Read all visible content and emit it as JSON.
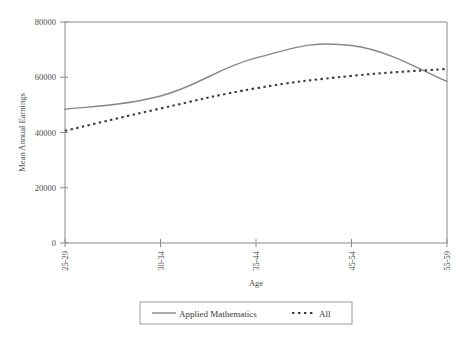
{
  "chart_data": {
    "type": "line",
    "title": "",
    "subtitle": "",
    "xlabel": "Age",
    "ylabel": "Mean Annual Earnings",
    "categories": [
      "25-29",
      "30-34",
      "35-44",
      "45-54",
      "55-59"
    ],
    "xtick_labels": [
      "25-29",
      "30-34",
      "35-44",
      "45-54",
      "55-59"
    ],
    "ytick_labels": [
      "0",
      "20000",
      "40000",
      "60000",
      "80000"
    ],
    "ytick_values": [
      0,
      20000,
      40000,
      60000,
      80000
    ],
    "ylim": [
      0,
      80000
    ],
    "grid": false,
    "legend_position": "bottom",
    "series": [
      {
        "name": "Applied Mathematics",
        "style": "solid",
        "color": "#878787",
        "values": [
          48400,
          53200,
          67000,
          71500,
          58500
        ],
        "peak_value": 72500,
        "peak_between": [
          "45-54",
          "55-59"
        ]
      },
      {
        "name": "All",
        "style": "dotted",
        "color": "#3c3c3c",
        "values": [
          40600,
          48700,
          56000,
          60500,
          63000
        ]
      }
    ],
    "annotations": []
  },
  "legend": {
    "entries": [
      {
        "label": "Applied Mathematics",
        "style": "solid",
        "color": "#878787"
      },
      {
        "label": "All",
        "style": "dotted",
        "color": "#3c3c3c"
      }
    ]
  },
  "colors": {
    "axis": "#8a8a8a",
    "text": "#3a3a3a",
    "background": "#ffffff",
    "series_applied_mathematics": "#878787",
    "series_all": "#3c3c3c"
  }
}
